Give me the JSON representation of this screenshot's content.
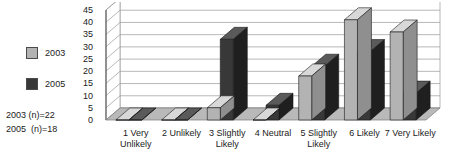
{
  "legend": {
    "entries": [
      {
        "label": "2003",
        "color": "#b3b3b3"
      },
      {
        "label": "2005",
        "color": "#383838"
      }
    ],
    "notes": [
      "2003 (n)=22",
      "2005  (n)=18"
    ]
  },
  "chart_data": {
    "type": "bar",
    "title": "",
    "subtitle": "",
    "xlabel": "",
    "ylabel": "",
    "ylim": [
      0,
      45
    ],
    "yticks": [
      0,
      5,
      10,
      15,
      20,
      25,
      30,
      35,
      40,
      45
    ],
    "ytick_labels": [
      "0",
      "5",
      "10",
      "15",
      "20",
      "25",
      "30",
      "35",
      "40",
      "45"
    ],
    "grid": true,
    "legend_position": "left",
    "three_d": true,
    "categories": [
      "1 Very\nUnlikely",
      "2 Unlikely",
      "3 Slightly\nLikely",
      "4 Neutral",
      "5 Slightly\nLikely",
      "6 Likely",
      "7 Very Likely"
    ],
    "series": [
      {
        "name": "2003",
        "color": "#b3b3b3",
        "values": [
          0,
          0,
          5,
          0,
          18,
          41,
          36
        ]
      },
      {
        "name": "2005",
        "color": "#383838",
        "values": [
          0,
          0,
          33,
          6,
          22,
          28,
          11
        ]
      }
    ]
  }
}
